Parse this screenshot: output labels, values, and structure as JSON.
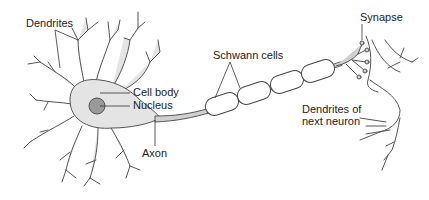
{
  "diagram": {
    "labels": {
      "dendrites": "Dendrites",
      "cell_body": "Cell body",
      "nucleus": "Nucleus",
      "axon": "Axon",
      "schwann_cells": "Schwann cells",
      "synapse": "Synapse",
      "next_dendrites_line1": "Dendrites of",
      "next_dendrites_line2": "next neuron"
    },
    "colors": {
      "cell_fill": "#e4e4e4",
      "nucleus_fill": "#9a9a9a",
      "outline": "#555555",
      "schwann_fill": "#ffffff",
      "text": "#222222"
    }
  }
}
